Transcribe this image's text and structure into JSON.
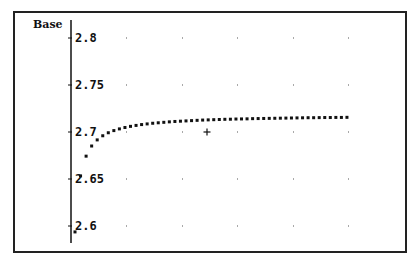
{
  "chart_data": {
    "type": "scatter",
    "title": "",
    "xlabel": "",
    "ylabel": "Base",
    "ylim": [
      2.59,
      2.82
    ],
    "yticks": [
      2.8,
      2.75,
      2.7,
      2.65,
      2.6
    ],
    "ytick_labels": [
      "2.8",
      "2.75",
      "2.7",
      "2.65",
      "2.6"
    ],
    "grid": "dotted points",
    "legend": null,
    "annotations": [
      {
        "type": "crosshair-cursor",
        "x_px": 207,
        "y_value": 2.7
      }
    ],
    "series": [
      {
        "name": "Base",
        "x": [
          10,
          20,
          30,
          40,
          50,
          60,
          70,
          80,
          90,
          100,
          110,
          120,
          130,
          140,
          150,
          160,
          170,
          180,
          190,
          200,
          210,
          220,
          230,
          240,
          250,
          260,
          270,
          280,
          290,
          300,
          310,
          320,
          330,
          340,
          350,
          360,
          370,
          380,
          390,
          400,
          410,
          420,
          430,
          440,
          450,
          460,
          470,
          480,
          490,
          500
        ],
        "values": [
          2.5937,
          2.6533,
          2.6743,
          2.6851,
          2.6916,
          2.696,
          2.6992,
          2.7015,
          2.7033,
          2.7048,
          2.706,
          2.707,
          2.7079,
          2.7086,
          2.7093,
          2.7098,
          2.7103,
          2.7108,
          2.7112,
          2.7115,
          2.7118,
          2.7121,
          2.7124,
          2.7127,
          2.7129,
          2.7131,
          2.7133,
          2.7135,
          2.7136,
          2.7138,
          2.7139,
          2.714,
          2.7142,
          2.7143,
          2.7144,
          2.7145,
          2.7146,
          2.7147,
          2.7148,
          2.7149,
          2.715,
          2.7151,
          2.7152,
          2.7152,
          2.7153,
          2.7154,
          2.7154,
          2.7155,
          2.7155,
          2.7156
        ]
      }
    ]
  },
  "axis": {
    "title": "Base",
    "tick_labels": [
      "2.8",
      "2.75",
      "2.7",
      "2.65",
      "2.6"
    ]
  },
  "colors": {
    "points": "#111111",
    "axis": "#111111",
    "grid": "#555555",
    "frame": "#222222"
  }
}
